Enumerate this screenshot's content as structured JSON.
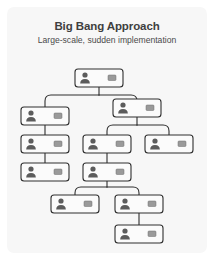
{
  "card": {
    "background_color": "#f7f7f7",
    "border_radius": 7
  },
  "header": {
    "title": "Big Bang Approach",
    "subtitle": "Large-scale, sudden implementation",
    "title_color": "#3f3f3f",
    "subtitle_color": "#4a4a4a"
  },
  "diagram": {
    "type": "org-chart",
    "node_icon": "person-avatar-icon",
    "node_secondary_icon": "label-bar-icon",
    "node_fill_color": "#fbfbfb",
    "node_stroke_color": "#2e2e2e",
    "connector_color": "#2e2e2e",
    "avatar_color": "#5c5c5c",
    "bar_color": "#9a9a9a",
    "node_count": 12,
    "nodes": [
      {
        "id": "n1",
        "level": 0,
        "x": 68,
        "y": 16,
        "w": 48,
        "h": 18,
        "parent": null,
        "label": ""
      },
      {
        "id": "n2",
        "level": 1,
        "x": 14,
        "y": 54,
        "w": 48,
        "h": 18,
        "parent": "n1",
        "label": ""
      },
      {
        "id": "n3",
        "level": 1,
        "x": 106,
        "y": 46,
        "w": 48,
        "h": 18,
        "parent": "n1",
        "label": ""
      },
      {
        "id": "n4",
        "level": 2,
        "x": 14,
        "y": 82,
        "w": 48,
        "h": 18,
        "parent": "n2",
        "label": ""
      },
      {
        "id": "n5",
        "level": 2,
        "x": 76,
        "y": 82,
        "w": 48,
        "h": 18,
        "parent": "n3",
        "label": ""
      },
      {
        "id": "n6",
        "level": 2,
        "x": 138,
        "y": 82,
        "w": 48,
        "h": 18,
        "parent": "n3",
        "label": ""
      },
      {
        "id": "n7",
        "level": 3,
        "x": 14,
        "y": 110,
        "w": 48,
        "h": 18,
        "parent": "n4",
        "label": ""
      },
      {
        "id": "n8",
        "level": 3,
        "x": 76,
        "y": 110,
        "w": 48,
        "h": 18,
        "parent": "n5",
        "label": ""
      },
      {
        "id": "n9",
        "level": 4,
        "x": 44,
        "y": 142,
        "w": 48,
        "h": 18,
        "parent": "n8",
        "label": ""
      },
      {
        "id": "n10",
        "level": 4,
        "x": 108,
        "y": 142,
        "w": 48,
        "h": 18,
        "parent": "n8",
        "label": ""
      },
      {
        "id": "n11",
        "level": 5,
        "x": 108,
        "y": 172,
        "w": 48,
        "h": 18,
        "parent": "n10",
        "label": ""
      }
    ]
  }
}
